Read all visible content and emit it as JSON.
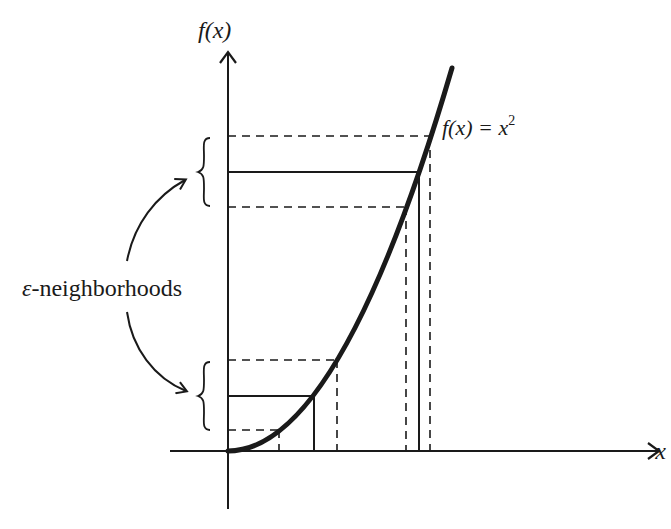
{
  "diagram": {
    "y_axis_label": "f(x)",
    "x_axis_label": "x",
    "curve_label_lhs": "f(x) = x",
    "curve_label_exp": "2",
    "annotation_symbol": "ε",
    "annotation_text": "-neighborhoods",
    "colors": {
      "ink": "#1a1a1a",
      "background": "#ffffff"
    },
    "function": "f(x) = x^2",
    "upper_neighborhood": {
      "dashed_top_y": 136,
      "solid_y": 172,
      "dashed_bottom_y": 207,
      "x_left": 406,
      "x_center": 419,
      "x_right": 430
    },
    "lower_neighborhood": {
      "dashed_top_y": 360,
      "solid_y": 396,
      "dashed_bottom_y": 430,
      "x_left": 279,
      "x_center": 314,
      "x_right": 337
    }
  }
}
